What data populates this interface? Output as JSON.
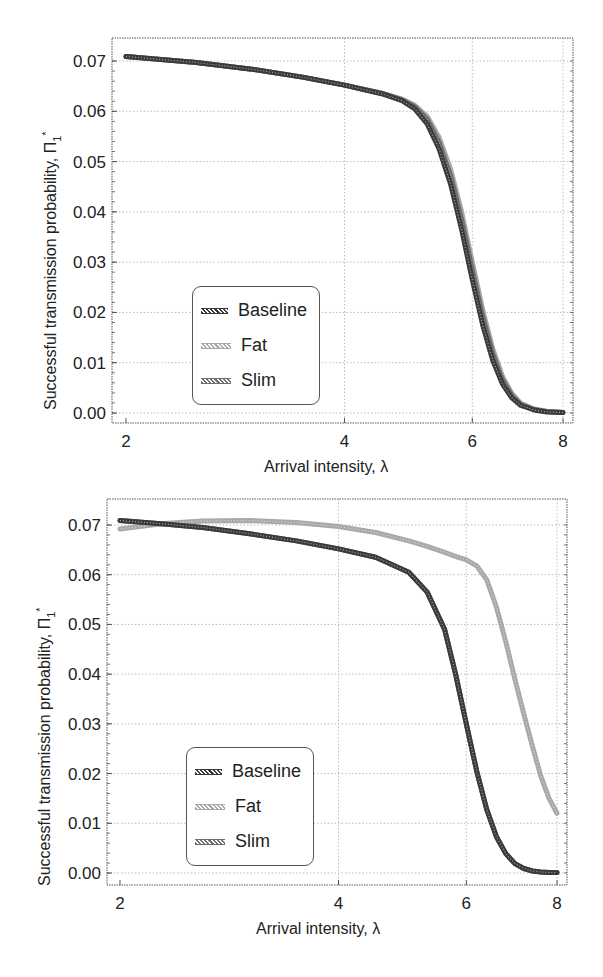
{
  "colors": {
    "baseline": "#3a3a3a",
    "fat": "#a8a8a8",
    "slim": "#6e6e6e",
    "grid": "#bdbdbd",
    "frame": "#555555"
  },
  "top": {
    "ylabel_text": "Successful transmission probability, Π",
    "ylabel_sub": "1",
    "ylabel_sup": "*",
    "xlabel": "Arrival intensity, λ",
    "legend": [
      "Baseline",
      "Fat",
      "Slim"
    ]
  },
  "bottom": {
    "ylabel_text": "Successful transmission probability, Π",
    "ylabel_sub": "1",
    "ylabel_sup": "*",
    "xlabel": "Arrival intensity, λ",
    "legend": [
      "Baseline",
      "Fat",
      "Slim"
    ]
  },
  "chart_data": [
    {
      "type": "line",
      "title": "",
      "xlabel": "Arrival intensity, λ",
      "ylabel": "Successful transmission probability, Π₁*",
      "xscale": "log",
      "xlim": [
        2,
        8
      ],
      "ylim": [
        0.0,
        0.07
      ],
      "xticks": [
        2,
        4,
        6,
        8
      ],
      "yticks": [
        0.0,
        0.01,
        0.02,
        0.03,
        0.04,
        0.05,
        0.06,
        0.07
      ],
      "ytick_labels": [
        "0.00",
        "0.01",
        "0.02",
        "0.03",
        "0.04",
        "0.05",
        "0.06",
        "0.07"
      ],
      "grid": true,
      "legend_position": "lower left",
      "x": [
        2.0,
        2.5,
        3.0,
        3.5,
        4.0,
        4.5,
        4.8,
        5.0,
        5.2,
        5.4,
        5.6,
        5.8,
        6.0,
        6.2,
        6.4,
        6.6,
        6.8,
        7.0,
        7.3,
        7.6,
        8.0
      ],
      "series": [
        {
          "name": "Baseline",
          "values": [
            0.0709,
            0.0697,
            0.0683,
            0.0668,
            0.0652,
            0.0635,
            0.0621,
            0.0605,
            0.0575,
            0.0525,
            0.0455,
            0.0365,
            0.0265,
            0.0175,
            0.0105,
            0.0058,
            0.003,
            0.0015,
            0.0006,
            0.0002,
            0.0001
          ]
        },
        {
          "name": "Fat",
          "values": [
            0.0709,
            0.0697,
            0.0683,
            0.0668,
            0.0652,
            0.0636,
            0.0624,
            0.0612,
            0.059,
            0.0548,
            0.0485,
            0.04,
            0.03,
            0.0205,
            0.0128,
            0.0073,
            0.0039,
            0.0019,
            0.0008,
            0.0003,
            0.0001
          ]
        },
        {
          "name": "Slim",
          "values": [
            0.0709,
            0.0697,
            0.0683,
            0.0668,
            0.0652,
            0.0636,
            0.0623,
            0.0609,
            0.0584,
            0.0538,
            0.0472,
            0.0385,
            0.0285,
            0.0192,
            0.0118,
            0.0066,
            0.0035,
            0.0017,
            0.0007,
            0.0003,
            0.0001
          ]
        }
      ]
    },
    {
      "type": "line",
      "title": "",
      "xlabel": "Arrival intensity, λ",
      "ylabel": "Successful transmission probability, Π₁*",
      "xscale": "log",
      "xlim": [
        2,
        8
      ],
      "ylim": [
        0.0,
        0.07
      ],
      "xticks": [
        2,
        4,
        6,
        8
      ],
      "yticks": [
        0.0,
        0.01,
        0.02,
        0.03,
        0.04,
        0.05,
        0.06,
        0.07
      ],
      "ytick_labels": [
        "0.00",
        "0.01",
        "0.02",
        "0.03",
        "0.04",
        "0.05",
        "0.06",
        "0.07"
      ],
      "grid": true,
      "legend_position": "lower left",
      "x": [
        2.0,
        2.3,
        2.6,
        3.0,
        3.5,
        4.0,
        4.5,
        5.0,
        5.3,
        5.6,
        5.8,
        6.0,
        6.2,
        6.4,
        6.6,
        6.8,
        7.0,
        7.2,
        7.4,
        7.6,
        7.8,
        8.0
      ],
      "series": [
        {
          "name": "Baseline",
          "values": [
            0.0709,
            0.0702,
            0.0695,
            0.0683,
            0.0668,
            0.0652,
            0.0635,
            0.0605,
            0.0565,
            0.049,
            0.04,
            0.03,
            0.0205,
            0.0128,
            0.0073,
            0.0039,
            0.0019,
            0.0009,
            0.0004,
            0.0002,
            0.0001,
            0.0001
          ]
        },
        {
          "name": "Fat",
          "values": [
            0.0692,
            0.0703,
            0.0708,
            0.0709,
            0.0705,
            0.0697,
            0.0685,
            0.0668,
            0.0657,
            0.0645,
            0.0637,
            0.063,
            0.0618,
            0.059,
            0.0535,
            0.0465,
            0.039,
            0.032,
            0.0255,
            0.0195,
            0.015,
            0.012
          ]
        },
        {
          "name": "Slim",
          "values": [
            0.0709,
            0.0702,
            0.0695,
            0.0683,
            0.0668,
            0.0652,
            0.0635,
            0.0605,
            0.0565,
            0.049,
            0.04,
            0.03,
            0.0205,
            0.0128,
            0.0073,
            0.0039,
            0.0019,
            0.0009,
            0.0004,
            0.0002,
            0.0001,
            0.0001
          ]
        }
      ]
    }
  ]
}
